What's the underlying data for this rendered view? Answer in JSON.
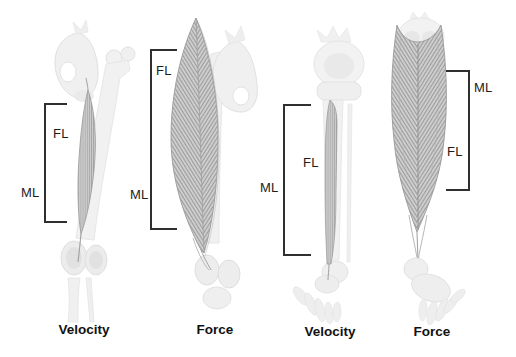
{
  "figure": {
    "colors": {
      "background": "#ffffff",
      "bracket_line": "#2f2f2f",
      "label_text": "#1c1c1c",
      "caption_text": "#111111",
      "bone": "#f0f0f0",
      "bone_edge": "#e2e2e2",
      "muscle_fill": "#cdcdcd",
      "muscle_fiber": "#8f8f8f"
    }
  },
  "panels": [
    {
      "id": "thigh-velocity",
      "caption": "Velocity",
      "fl_label": "FL",
      "ml_label": "ML"
    },
    {
      "id": "thigh-force",
      "caption": "Force",
      "fl_label": "FL",
      "ml_label": "ML"
    },
    {
      "id": "lower-leg-velocity",
      "caption": "Velocity",
      "fl_label": "FL",
      "ml_label": "ML"
    },
    {
      "id": "lower-leg-force",
      "caption": "Force",
      "fl_label": "FL",
      "ml_label": "ML"
    }
  ]
}
